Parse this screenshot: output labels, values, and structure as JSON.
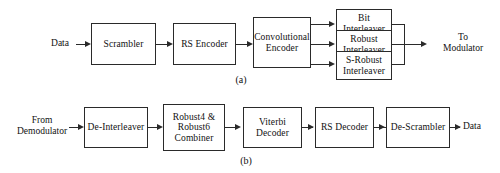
{
  "figure": {
    "diagram_a": {
      "caption": "(a)",
      "input_label": "Data",
      "output_label": "To\nModulator",
      "blocks": [
        {
          "id": "scrambler",
          "label": "Scrambler"
        },
        {
          "id": "rs-encoder",
          "label": "RS Encoder"
        },
        {
          "id": "convolutional-encoder",
          "label": "Convolutional\nEncoder"
        },
        {
          "id": "bit-interleaver",
          "label": "Bit\nInterleaver"
        },
        {
          "id": "robust-interleaver",
          "label": "Robust\nInterleaver"
        },
        {
          "id": "s-robust-interleaver",
          "label": "S-Robust\nInterleaver"
        }
      ]
    },
    "diagram_b": {
      "caption": "(b)",
      "input_label": "From\nDemodulator",
      "output_label": "Data",
      "blocks": [
        {
          "id": "de-interleaver",
          "label": "De-Interleaver"
        },
        {
          "id": "robust-combiner",
          "label": "Robust4 &\nRobust6\nCombiner"
        },
        {
          "id": "viterbi-decoder",
          "label": "Viterbi\nDecoder"
        },
        {
          "id": "rs-decoder",
          "label": "RS Decoder"
        },
        {
          "id": "de-scrambler",
          "label": "De-Scrambler"
        }
      ]
    },
    "colors": {
      "stroke": "#2a2a2a",
      "text": "#111111",
      "background": "#ffffff"
    }
  }
}
